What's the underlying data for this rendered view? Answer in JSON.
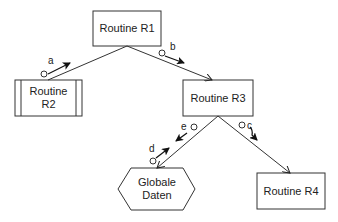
{
  "diagram": {
    "type": "structure-chart",
    "nodes": [
      {
        "id": "R1",
        "label": "Routine R1",
        "shape": "rectangle"
      },
      {
        "id": "R2",
        "label": "Routine R2",
        "shape": "predefined-process"
      },
      {
        "id": "R3",
        "label": "Routine R3",
        "shape": "rectangle"
      },
      {
        "id": "GD",
        "label": "Globale\nDaten",
        "label_lines": [
          "Globale",
          "Daten"
        ],
        "shape": "hexagon"
      },
      {
        "id": "R4",
        "label": "Routine R4",
        "shape": "rectangle"
      }
    ],
    "edges": [
      {
        "from": "R1",
        "to": "R2"
      },
      {
        "from": "R1",
        "to": "R3"
      },
      {
        "from": "R3",
        "to": "GD"
      },
      {
        "from": "R3",
        "to": "R4"
      }
    ],
    "data_flows": [
      {
        "label": "a",
        "edge": "R1-R2",
        "direction": "up"
      },
      {
        "label": "b",
        "edge": "R1-R3",
        "direction": "down"
      },
      {
        "label": "e",
        "edge": "R3-GD",
        "direction": "down"
      },
      {
        "label": "d",
        "edge": "R3-GD",
        "direction": "up"
      },
      {
        "label": "c",
        "edge": "R3-R4",
        "direction": "down"
      }
    ]
  }
}
